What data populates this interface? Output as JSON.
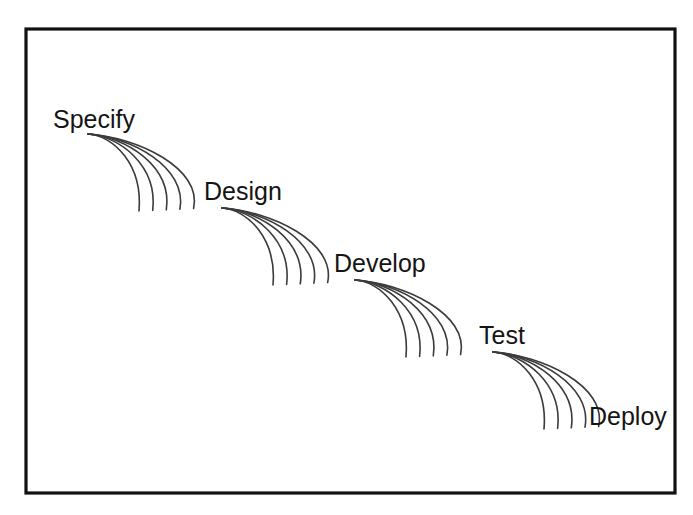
{
  "diagram": {
    "kind": "waterfall-model-diagram",
    "background_color": "#ffffff",
    "frame": {
      "name": "outer-border",
      "x": 26,
      "y": 29,
      "width": 649,
      "height": 464,
      "stroke_color": "#111111",
      "stroke_width": 3.2
    },
    "label_color": "#141414",
    "curve_color": "#3b3b3b",
    "curve_width": 1.6,
    "curves_per_cascade": 5,
    "stages": [
      {
        "id": "specify",
        "label": "Specify",
        "order": 1,
        "label_x": 53,
        "label_y": 128,
        "has_cascade": true,
        "cascade": {
          "name": "cascade-specify-to-design",
          "origin_x": 88,
          "origin_y": 134,
          "top_span": 56,
          "drop": 76,
          "spread": 14,
          "bottom_x": 139,
          "bottom_y": 211
        }
      },
      {
        "id": "design",
        "label": "Design",
        "order": 2,
        "label_x": 204,
        "label_y": 200,
        "has_cascade": true,
        "cascade": {
          "name": "cascade-design-to-develop",
          "origin_x": 222,
          "origin_y": 208,
          "top_span": 56,
          "drop": 76,
          "spread": 14,
          "bottom_x": 273,
          "bottom_y": 285
        }
      },
      {
        "id": "develop",
        "label": "Develop",
        "order": 3,
        "label_x": 334,
        "label_y": 272,
        "has_cascade": true,
        "cascade": {
          "name": "cascade-develop-to-test",
          "origin_x": 355,
          "origin_y": 280,
          "top_span": 56,
          "drop": 76,
          "spread": 14,
          "bottom_x": 406,
          "bottom_y": 357
        }
      },
      {
        "id": "test",
        "label": "Test",
        "order": 4,
        "label_x": 479,
        "label_y": 344,
        "has_cascade": true,
        "cascade": {
          "name": "cascade-test-to-deploy",
          "origin_x": 493,
          "origin_y": 352,
          "top_span": 56,
          "drop": 76,
          "spread": 14,
          "bottom_x": 544,
          "bottom_y": 429
        }
      },
      {
        "id": "deploy",
        "label": "Deploy",
        "order": 5,
        "label_x": 589,
        "label_y": 425,
        "has_cascade": false,
        "cascade": null
      }
    ]
  }
}
